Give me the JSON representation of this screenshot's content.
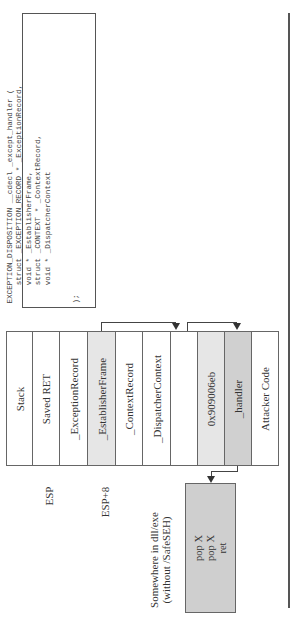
{
  "code_box": {
    "lines": [
      "EXCEPTION_DISPOSITION __cdecl _except_handler (",
      "    struct _EXCEPTION_RECORD * _ExceptionRecord,",
      "    void * _EstablisherFrame,",
      "    struct _CONTEXT * _ContextRecord,",
      "    void * _DispatcherContext",
      "",
      "",
      ");"
    ]
  },
  "stack": {
    "cells": [
      {
        "label": "Stack",
        "shade": "none"
      },
      {
        "label": "Saved RET",
        "shade": "none"
      },
      {
        "label": "_ExceptionRecord",
        "shade": "none"
      },
      {
        "label": "_EstablisherFrame",
        "shade": "light"
      },
      {
        "label": "_ContextRecord",
        "shade": "none"
      },
      {
        "label": "_DispatcherContext",
        "shade": "none"
      },
      {
        "label": "",
        "shade": "none"
      },
      {
        "label": "0x909006eb",
        "shade": "light"
      },
      {
        "label": "_handler",
        "shade": "dark"
      },
      {
        "label": "Attacker Code",
        "shade": "none"
      }
    ]
  },
  "pointers": {
    "esp": "ESP",
    "esp8": "ESP+8"
  },
  "gadget": {
    "location_line1": "Somewhere in dll/exe",
    "location_line2": "(without /SafeSEH)",
    "instructions": [
      "pop X",
      "pop X",
      "ret"
    ]
  },
  "colors": {
    "light_shade": "#e6e6e6",
    "dark_shade": "#d0d0d0",
    "gadget_fill": "#cfcfcf",
    "border": "#666666"
  }
}
